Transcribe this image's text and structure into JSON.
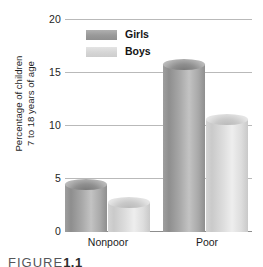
{
  "figure": {
    "caption_prefix": "FIGURE",
    "caption_number": "1.1"
  },
  "chart_data": {
    "type": "bar",
    "title": "",
    "xlabel": "",
    "ylabel": "Percentage of children 7 to 18 years of age",
    "ylabel_line1": "Percentage of children",
    "ylabel_line2": "7 to 18 years of age",
    "categories": [
      "Nonpoor",
      "Poor"
    ],
    "series": [
      {
        "name": "Girls",
        "color": "#9a9a9a",
        "values": [
          5.0,
          16.3
        ]
      },
      {
        "name": "Boys",
        "color": "#d6d6d6",
        "values": [
          3.3,
          11.1
        ]
      }
    ],
    "ylim": [
      0,
      20
    ],
    "yticks": [
      0,
      5,
      10,
      15,
      20
    ],
    "ytick_labels": [
      "0",
      "5",
      "10",
      "15",
      "20"
    ],
    "grid": true,
    "legend_position": "top-center"
  }
}
